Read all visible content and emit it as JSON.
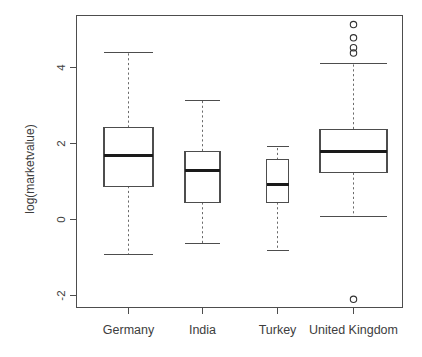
{
  "chart_data": {
    "type": "box",
    "title": "",
    "xlabel": "",
    "ylabel": "log(marketvalue)",
    "ylim": [
      -2.8,
      5.45
    ],
    "yticks": [
      -2,
      0,
      2,
      4
    ],
    "ytick_labels": [
      "-2",
      "0",
      "2",
      "4"
    ],
    "grid": false,
    "legend": "none",
    "categories": [
      "Germany",
      "India",
      "Turkey",
      "United Kingdom"
    ],
    "boxes": [
      {
        "category": "Germany",
        "whisker_low": -0.93,
        "q1": 0.88,
        "median": 1.68,
        "q3": 2.42,
        "whisker_high": 4.4,
        "outliers": []
      },
      {
        "category": "India",
        "whisker_low": -0.62,
        "q1": 0.45,
        "median": 1.28,
        "q3": 1.8,
        "whisker_high": 3.12,
        "outliers": []
      },
      {
        "category": "Turkey",
        "whisker_low": -0.82,
        "q1": 0.45,
        "median": 0.92,
        "q3": 1.57,
        "whisker_high": 1.92,
        "outliers": []
      },
      {
        "category": "United Kingdom",
        "whisker_low": 0.08,
        "q1": 1.23,
        "median": 1.78,
        "q3": 2.38,
        "whisker_high": 4.1,
        "outliers": [
          5.13,
          4.78,
          4.52,
          4.38,
          -2.1
        ]
      }
    ]
  },
  "axes": {
    "y_axis_label": "log(marketvalue)",
    "y_tick_labels": [
      "4",
      "2",
      "0",
      "-2"
    ],
    "x_tick_labels": [
      "Germany",
      "India",
      "Turkey",
      "United Kingdom"
    ]
  },
  "colors": {
    "background": "#ffffff",
    "frame": "#4d4d4d",
    "median": "#1a1a1a",
    "whisker": "#6b6b6b",
    "outlier": "#333333",
    "text": "#3d3d3d"
  }
}
